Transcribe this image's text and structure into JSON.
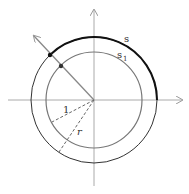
{
  "diagram": {
    "center": {
      "x": 94,
      "y": 100
    },
    "outer_circle": {
      "label": "s",
      "radius": 63,
      "color": "#222222"
    },
    "inner_circle": {
      "label": "s",
      "subscript": "1",
      "radius": 48,
      "color": "#666666"
    },
    "inner_radius_label": "1",
    "outer_radius_label": "r",
    "axes": {
      "color": "#999999"
    },
    "ray_color": "#888888",
    "highlight_arc_color": "#111111"
  }
}
